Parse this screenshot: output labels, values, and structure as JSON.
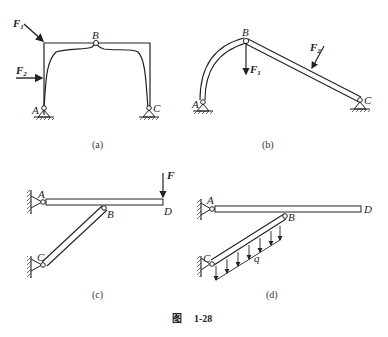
{
  "figure": {
    "caption_prefix": "图",
    "caption_number": "1-28"
  },
  "panels": [
    {
      "id": "a",
      "caption": "(a)",
      "labels": {
        "A": "A",
        "B": "B",
        "C": "C"
      },
      "forces": [
        {
          "name": "F",
          "sub": "1"
        },
        {
          "name": "F",
          "sub": "2"
        }
      ]
    },
    {
      "id": "b",
      "caption": "(b)",
      "labels": {
        "A": "A",
        "B": "B",
        "C": "C"
      },
      "forces": [
        {
          "name": "F",
          "sub": "1"
        },
        {
          "name": "F",
          "sub": "2"
        }
      ]
    },
    {
      "id": "c",
      "caption": "(c)",
      "labels": {
        "A": "A",
        "B": "B",
        "C": "C",
        "D": "D"
      },
      "forces": [
        {
          "name": "F"
        }
      ]
    },
    {
      "id": "d",
      "caption": "(d)",
      "labels": {
        "A": "A",
        "B": "B",
        "C": "C",
        "D": "D"
      },
      "load": "q"
    }
  ]
}
